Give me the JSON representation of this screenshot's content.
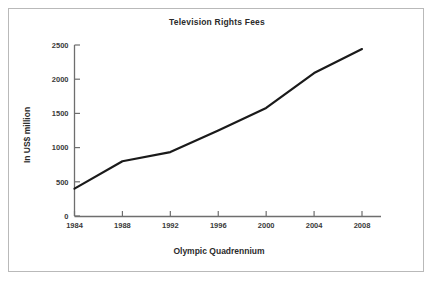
{
  "figure": {
    "border_color": "#b9b9b9",
    "background": "#ffffff"
  },
  "chart_data": {
    "type": "line",
    "title": "Television Rights Fees",
    "xlabel": "Olympic Quadrennium",
    "ylabel": "In US$ million",
    "categories": [
      "1984",
      "1988",
      "1992",
      "1996",
      "2000",
      "2004",
      "2008"
    ],
    "x": [
      1984,
      1988,
      1992,
      1996,
      2000,
      2004,
      2008
    ],
    "values": [
      400,
      800,
      935,
      1250,
      1580,
      2090,
      2440
    ],
    "series": [
      {
        "name": "Television Rights Fees",
        "values": [
          400,
          800,
          935,
          1250,
          1580,
          2090,
          2440
        ]
      }
    ],
    "ylim": [
      0,
      2500
    ],
    "yticks": [
      0,
      500,
      1000,
      1500,
      2000,
      2500
    ],
    "ytick_labels": [
      "0",
      "500",
      "1000",
      "1500",
      "2000",
      "2500"
    ],
    "xtick_labels": [
      "1984",
      "1988",
      "1992",
      "1996",
      "2000",
      "2004",
      "2008"
    ],
    "grid": false,
    "legend": false,
    "line_color": "#1a1a1a",
    "line_width": 2.2,
    "axis_color": "#6e6e6e"
  }
}
